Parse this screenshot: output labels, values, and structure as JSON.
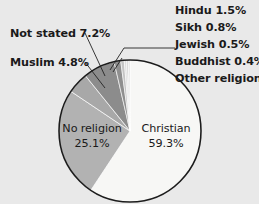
{
  "background_color": "#e9e9e9",
  "chart_data": {
    "type": "pie",
    "title": "",
    "subtitle": "",
    "xlabel": "",
    "ylabel": "",
    "legend_position": "none",
    "grid": false,
    "start_angle_deg": 0,
    "direction": "clockwise",
    "center": {
      "x": 130,
      "y": 131
    },
    "radius": 71,
    "categories": [
      "Christian",
      "No religion",
      "Muslim",
      "Not stated",
      "Hindu",
      "Sikh",
      "Jewish",
      "Buddhist",
      "Other religion"
    ],
    "values": [
      59.3,
      25.1,
      4.8,
      7.2,
      1.5,
      0.8,
      0.5,
      0.4,
      0.4
    ],
    "units": "%",
    "slices": [
      {
        "name": "Christian",
        "value": 59.3,
        "label": "Christian",
        "value_label": "59.3%",
        "color": "#f7f7f5",
        "label_placement": "inside"
      },
      {
        "name": "No religion",
        "value": 25.1,
        "label": "No religion",
        "value_label": "25.1%",
        "color": "#b2b2b2",
        "label_placement": "inside"
      },
      {
        "name": "Muslim",
        "value": 4.8,
        "label": "Muslim",
        "value_label": "4.8%",
        "color": "#a8a8a8",
        "label_placement": "leader-left"
      },
      {
        "name": "Not stated",
        "value": 7.2,
        "label": "Not stated",
        "value_label": "7.2%",
        "color": "#8c8c8c",
        "label_placement": "leader-left"
      },
      {
        "name": "Hindu",
        "value": 1.5,
        "label": "Hindu",
        "value_label": "1.5%",
        "color": "#8f8f8f",
        "label_placement": "stack-right"
      },
      {
        "name": "Sikh",
        "value": 0.8,
        "label": "Sikh",
        "value_label": "0.8%",
        "color": "#c4c4c4",
        "label_placement": "stack-right"
      },
      {
        "name": "Jewish",
        "value": 0.5,
        "label": "Jewish",
        "value_label": "0.5%",
        "color": "#dcdcdc",
        "label_placement": "stack-right"
      },
      {
        "name": "Buddhist",
        "value": 0.4,
        "label": "Buddhist",
        "value_label": "0.4%",
        "color": "#cfcfcf",
        "label_placement": "stack-right"
      },
      {
        "name": "Other religion",
        "value": 0.4,
        "label": "Other religion",
        "value_label": "0.4%",
        "color": "#e2e2e2",
        "label_placement": "stack-right"
      }
    ]
  },
  "labels": {
    "right_stack": [
      {
        "text": "Hindu 1.5%"
      },
      {
        "text": "Sikh 0.8%"
      },
      {
        "text": "Jewish 0.5%"
      },
      {
        "text": "Buddhist 0.4%"
      },
      {
        "text": "Other religion 0.4%"
      }
    ],
    "left": [
      {
        "text": "Not stated 7.2%"
      },
      {
        "text": "Muslim 4.8%"
      }
    ],
    "inside": [
      {
        "name": "Christian",
        "line1": "Christian",
        "line2": "59.3%"
      },
      {
        "name": "No religion",
        "line1": "No religion",
        "line2": "25.1%"
      }
    ]
  }
}
